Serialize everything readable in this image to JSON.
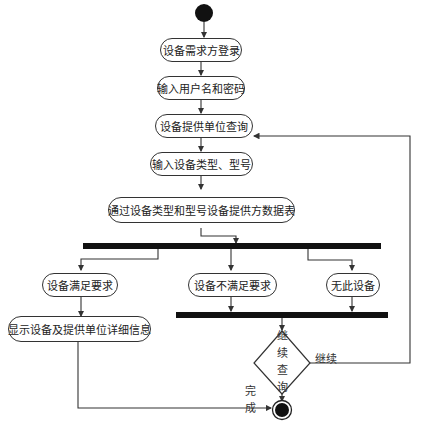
{
  "diagram": {
    "type": "UML activity diagram",
    "nodes": {
      "login": "设备需求方登录",
      "input_credentials": "输入用户名和密码",
      "supplier_query": "设备提供单位查询",
      "input_type_model": "输入设备类型、型号",
      "search_table": "通过设备类型和型号设备提供方数据表",
      "meets_requirements": "设备满足要求",
      "not_meets_requirements": "设备不满足要求",
      "no_device": "无此设备",
      "show_details": "显示设备及提供单位详细信息"
    },
    "decision": {
      "chars": [
        "继",
        "续",
        "查",
        "询"
      ],
      "label": "继续查询"
    },
    "edge_labels": {
      "continue": "继续",
      "done_chars": [
        "完",
        "成"
      ],
      "done": "完成"
    },
    "colors": {
      "line": "#333333",
      "bar": "#111111",
      "background": "#ffffff"
    }
  }
}
